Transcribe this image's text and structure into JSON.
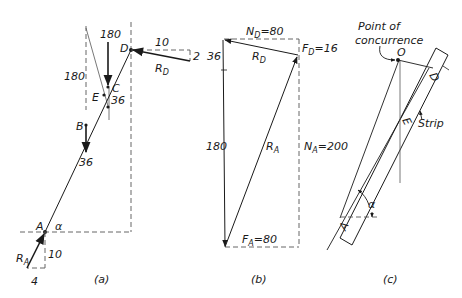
{
  "figure": {
    "panel_a": {
      "caption": "(a)",
      "labels": {
        "D": "D",
        "C": "C",
        "E": "E",
        "B": "B",
        "A": "A",
        "alpha": "α",
        "force_top": "180",
        "force_left": "180",
        "force_C": "36",
        "force_B": "36",
        "RD_h": "10",
        "RD_v": "2",
        "RA_v": "10",
        "RA_h": "4"
      },
      "RD": {
        "main": "R",
        "sub": "D"
      },
      "RA": {
        "main": "R",
        "sub": "A"
      }
    },
    "panel_b": {
      "caption": "(b)",
      "ND": {
        "main": "N",
        "sub": "D",
        "value": "=80"
      },
      "FD": {
        "main": "F",
        "sub": "D",
        "value": "=16"
      },
      "NA": {
        "main": "N",
        "sub": "A",
        "value": "=200"
      },
      "FA": {
        "main": "F",
        "sub": "A",
        "value": "=80"
      },
      "RD": {
        "main": "R",
        "sub": "D"
      },
      "RA": {
        "main": "R",
        "sub": "A"
      },
      "vert_top": "36",
      "vert_main": "180"
    },
    "panel_c": {
      "caption": "(c)",
      "concurrence_line1": "Point of",
      "concurrence_line2": "concurrence",
      "O": "O",
      "D": "D",
      "E": "E",
      "A": "A",
      "strip": "Strip",
      "alpha": "α"
    }
  }
}
